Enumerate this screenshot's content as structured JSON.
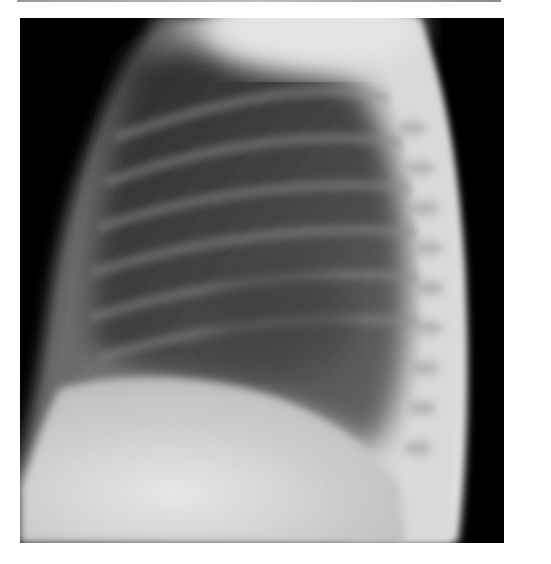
{
  "figure": {
    "type": "radiograph",
    "description": "Lateral chest X-ray"
  }
}
